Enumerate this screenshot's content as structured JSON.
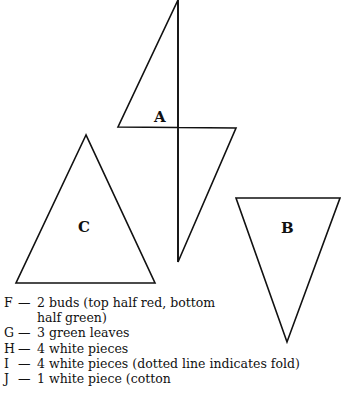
{
  "diagram": {
    "shapes": [
      {
        "id": "A",
        "type": "diamond",
        "label": "A",
        "note": "vertical fold line through center"
      },
      {
        "id": "B",
        "type": "inverted-triangle",
        "label": "B"
      },
      {
        "id": "C",
        "type": "triangle",
        "label": "C"
      }
    ],
    "stroke_color": "#111111"
  },
  "legend": {
    "items": [
      {
        "key": "F",
        "dash": "—",
        "text": "2 buds (top half red, bottom",
        "continuation": "half green)"
      },
      {
        "key": "G",
        "dash": "—",
        "text": "3 green leaves"
      },
      {
        "key": "H",
        "dash": "—",
        "text": "4 white pieces"
      },
      {
        "key": "I",
        "dash": "—",
        "text": "4 white pieces (dotted line indicates fold)"
      },
      {
        "key": "J",
        "dash": "—",
        "text": "1 white piece (cotton"
      }
    ]
  }
}
